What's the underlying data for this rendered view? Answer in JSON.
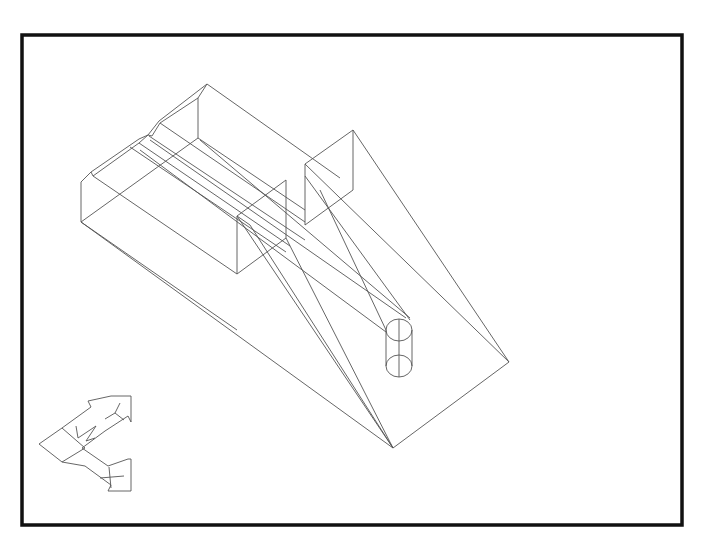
{
  "drawing": {
    "type": "isometric-wireframe",
    "line_color": "#555555",
    "frame_color": "#111111",
    "background": "#ffffff"
  },
  "viewport_frame": {
    "x": 22,
    "y": 35,
    "width": 660,
    "height": 490
  },
  "ucs_icon": {
    "axis_x_label": "X",
    "axis_y_label": "Y",
    "w_marker": "W"
  },
  "objects": [
    {
      "name": "stepped-block",
      "kind": "extruded-profile"
    },
    {
      "name": "upright-box-a",
      "kind": "box"
    },
    {
      "name": "upright-box-b",
      "kind": "box"
    },
    {
      "name": "cylinder",
      "kind": "cylinder"
    },
    {
      "name": "base-plate",
      "kind": "polygon"
    }
  ]
}
